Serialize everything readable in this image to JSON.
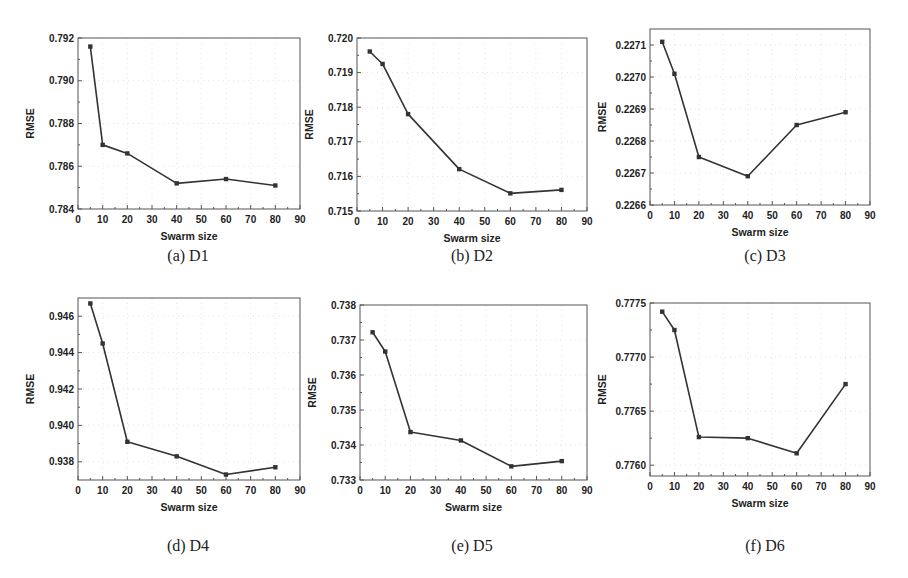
{
  "chart_data": [
    {
      "id": "a",
      "type": "line",
      "caption": "(a) D1",
      "xlabel": "Swarm size",
      "ylabel": "RMSE",
      "x": [
        5,
        10,
        20,
        40,
        60,
        80
      ],
      "values": [
        0.7916,
        0.787,
        0.7866,
        0.7852,
        0.7854,
        0.7851
      ],
      "xlim": [
        0,
        90
      ],
      "ylim": [
        0.784,
        0.792
      ],
      "xticks": [
        0,
        10,
        20,
        30,
        40,
        50,
        60,
        70,
        80,
        90
      ],
      "yticks": [
        0.784,
        0.786,
        0.788,
        0.79,
        0.792
      ],
      "ytick_labels": [
        "0.784",
        "0.786",
        "0.788",
        "0.790",
        "0.792"
      ],
      "grid": true,
      "box": {
        "left": 78,
        "top": 38,
        "right": 300,
        "bottom": 209
      }
    },
    {
      "id": "b",
      "type": "line",
      "caption": "(b) D2",
      "xlabel": "Swarm size",
      "ylabel": "RMSE",
      "x": [
        5,
        10,
        20,
        40,
        60,
        80
      ],
      "values": [
        0.71961,
        0.71925,
        0.7178,
        0.71621,
        0.71551,
        0.71561
      ],
      "xlim": [
        0,
        90
      ],
      "ylim": [
        0.715,
        0.72
      ],
      "xticks": [
        0,
        10,
        20,
        30,
        40,
        50,
        60,
        70,
        80,
        90
      ],
      "yticks": [
        0.715,
        0.716,
        0.717,
        0.718,
        0.719,
        0.72
      ],
      "ytick_labels": [
        "0.715",
        "0.716",
        "0.717",
        "0.718",
        "0.719",
        "0.720"
      ],
      "grid": true,
      "box": {
        "left": 357,
        "top": 38,
        "right": 587,
        "bottom": 211
      }
    },
    {
      "id": "c",
      "type": "line",
      "caption": "(c) D3",
      "xlabel": "Swarm size",
      "ylabel": "RMSE",
      "x": [
        5,
        10,
        20,
        40,
        60,
        80
      ],
      "values": [
        0.22711,
        0.22701,
        0.22675,
        0.22669,
        0.22685,
        0.22689
      ],
      "xlim": [
        0,
        90
      ],
      "ylim": [
        0.2266,
        0.22715
      ],
      "xticks": [
        0,
        10,
        20,
        30,
        40,
        50,
        60,
        70,
        80,
        90
      ],
      "yticks": [
        0.2266,
        0.2267,
        0.2268,
        0.2269,
        0.227,
        0.2271
      ],
      "ytick_labels": [
        "0.2266",
        "0.2267",
        "0.2268",
        "0.2269",
        "0.2270",
        "0.2271"
      ],
      "grid": true,
      "box": {
        "left": 650,
        "top": 29,
        "right": 870,
        "bottom": 205
      }
    },
    {
      "id": "d",
      "type": "line",
      "caption": "(d) D4",
      "xlabel": "Swarm size",
      "ylabel": "RMSE",
      "x": [
        5,
        10,
        20,
        40,
        60,
        80
      ],
      "values": [
        0.9467,
        0.9445,
        0.9391,
        0.9383,
        0.9373,
        0.9377
      ],
      "xlim": [
        0,
        90
      ],
      "ylim": [
        0.937,
        0.947
      ],
      "xticks": [
        0,
        10,
        20,
        30,
        40,
        50,
        60,
        70,
        80,
        90
      ],
      "yticks": [
        0.938,
        0.94,
        0.942,
        0.944,
        0.946
      ],
      "ytick_labels": [
        "0.938",
        "0.940",
        "0.942",
        "0.944",
        "0.946"
      ],
      "grid": true,
      "box": {
        "left": 78,
        "top": 298,
        "right": 300,
        "bottom": 480
      }
    },
    {
      "id": "e",
      "type": "line",
      "caption": "(e) D5",
      "xlabel": "Swarm size",
      "ylabel": "RMSE",
      "x": [
        5,
        10,
        20,
        40,
        60,
        80
      ],
      "values": [
        0.73722,
        0.73667,
        0.73437,
        0.73413,
        0.73339,
        0.73354
      ],
      "xlim": [
        0,
        90
      ],
      "ylim": [
        0.733,
        0.738
      ],
      "xticks": [
        0,
        10,
        20,
        30,
        40,
        50,
        60,
        70,
        80,
        90
      ],
      "yticks": [
        0.733,
        0.734,
        0.735,
        0.736,
        0.737,
        0.738
      ],
      "ytick_labels": [
        "0.733",
        "0.734",
        "0.735",
        "0.736",
        "0.737",
        "0.738"
      ],
      "grid": true,
      "box": {
        "left": 360,
        "top": 305,
        "right": 587,
        "bottom": 480
      }
    },
    {
      "id": "f",
      "type": "line",
      "caption": "(f) D6",
      "xlabel": "Swarm size",
      "ylabel": "RMSE",
      "x": [
        5,
        10,
        20,
        40,
        60,
        80
      ],
      "values": [
        0.77742,
        0.77725,
        0.77626,
        0.77625,
        0.77611,
        0.77675
      ],
      "xlim": [
        0,
        90
      ],
      "ylim": [
        0.7759,
        0.7775
      ],
      "xticks": [
        0,
        10,
        20,
        30,
        40,
        50,
        60,
        70,
        80,
        90
      ],
      "yticks": [
        0.776,
        0.7765,
        0.777,
        0.7775
      ],
      "ytick_labels": [
        "0.7760",
        "0.7765",
        "0.7770",
        "0.7775"
      ],
      "grid": true,
      "box": {
        "left": 650,
        "top": 303,
        "right": 870,
        "bottom": 476
      }
    }
  ],
  "captions": {
    "a": "(a) D1",
    "b": "(b) D2",
    "c": "(c) D3",
    "d": "(d) D4",
    "e": "(e) D5",
    "f": "(f) D6"
  },
  "colors": {
    "line": "#333333",
    "frame": "#555555",
    "grid": "#e4e4e4",
    "text": "#222222"
  }
}
